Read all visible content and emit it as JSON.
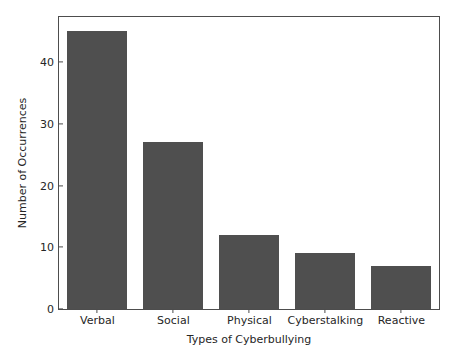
{
  "chart_data": {
    "type": "bar",
    "title": "",
    "xlabel": "Types of Cyberbullying",
    "ylabel": "Number of Occurrences",
    "categories": [
      "Verbal",
      "Social",
      "Physical",
      "Cyberstalking",
      "Reactive"
    ],
    "values": [
      45,
      27,
      12,
      9,
      7
    ],
    "ylim": [
      0,
      47.3
    ],
    "yticks": [
      0,
      10,
      20,
      30,
      40
    ],
    "ytick_labels": [
      "0",
      "10",
      "20",
      "30",
      "40"
    ],
    "xtick_labels": [
      "Verbal",
      "Social",
      "Physical",
      "Cyberstalking",
      "Reactive"
    ],
    "grid": false,
    "legend": null,
    "legend_position": "none",
    "bar_color": "#4f4f4f",
    "axes_edge_color": "#4d4d4d",
    "background_color": "#ffffff",
    "text_color": "#262626",
    "bar_width_fraction": 0.8
  }
}
